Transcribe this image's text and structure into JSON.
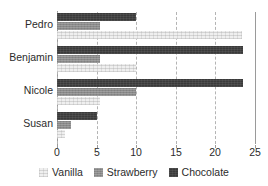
{
  "chart_data": {
    "type": "bar",
    "orientation": "horizontal",
    "title": "",
    "xlabel": "",
    "ylabel": "",
    "categories": [
      "Pedro",
      "Benjamin",
      "Nicole",
      "Susan"
    ],
    "series": [
      {
        "name": "Vanilla",
        "color": "#efefef",
        "values": [
          23.4,
          10.0,
          5.4,
          1.0
        ]
      },
      {
        "name": "Strawberry",
        "color": "#8a8a8a",
        "values": [
          5.4,
          5.4,
          10.0,
          1.8
        ]
      },
      {
        "name": "Chocolate",
        "color": "#3a3a3a",
        "values": [
          10.0,
          23.5,
          23.5,
          5.0
        ]
      }
    ],
    "bar_order_top_to_bottom": [
      "Chocolate",
      "Strawberry",
      "Vanilla"
    ],
    "xlim": [
      0,
      25
    ],
    "xticks": [
      0,
      5,
      10,
      15,
      20,
      25
    ],
    "xtick_labels": [
      "0",
      "5",
      "10",
      "15",
      "20",
      "25"
    ],
    "grid": true,
    "grid_axis": "x",
    "grid_style": "dashed",
    "legend_position": "bottom"
  },
  "legend": {
    "items": [
      {
        "label": "Vanilla"
      },
      {
        "label": "Strawberry"
      },
      {
        "label": "Chocolate"
      }
    ]
  }
}
